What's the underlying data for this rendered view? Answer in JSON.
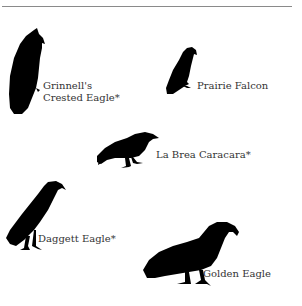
{
  "figure": {
    "colors": {
      "silhouette": "#000000",
      "text": "#333333",
      "rule": "#8a8a8a",
      "background": "#ffffff"
    },
    "birds": [
      {
        "name_line1": "Grinnell's",
        "name_line2": "Crested Eagle*",
        "icon": "crested-eagle-silhouette-icon",
        "extinct": true
      },
      {
        "name": "Prairie Falcon",
        "icon": "falcon-silhouette-icon",
        "extinct": false
      },
      {
        "name": "La Brea Caracara*",
        "icon": "caracara-silhouette-icon",
        "extinct": true
      },
      {
        "name": "Daggett Eagle*",
        "icon": "eagle-silhouette-icon",
        "extinct": true
      },
      {
        "name": "Golden Eagle",
        "icon": "golden-eagle-silhouette-icon",
        "extinct": false
      }
    ]
  }
}
